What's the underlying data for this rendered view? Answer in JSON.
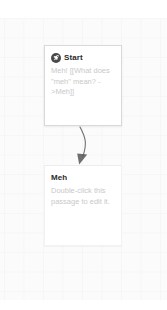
{
  "app": {
    "name": "Twine Story Map",
    "canvas_background": "#fbfbfb",
    "grid_color": "#f0f0f0"
  },
  "story_map": {
    "link_color": "#565656",
    "passages": [
      {
        "id": "start",
        "title": "Start",
        "excerpt": "Meh! [[What does \"meh\" mean? ->Meh]]",
        "is_start": true,
        "badge_icon": "rocket-icon",
        "badge_color": "#4a4a4a",
        "x": 44,
        "y": 27,
        "width": 78,
        "height": 81
      },
      {
        "id": "meh",
        "title": "Meh",
        "excerpt": "Double-click this passage to edit it.",
        "is_start": false,
        "badge_icon": "",
        "badge_color": "",
        "x": 44,
        "y": 147,
        "width": 78,
        "height": 81
      }
    ],
    "links": [
      {
        "id": "start-to-meh",
        "from": "start",
        "to": "meh",
        "arrow": "arrowhead-icon"
      }
    ]
  }
}
